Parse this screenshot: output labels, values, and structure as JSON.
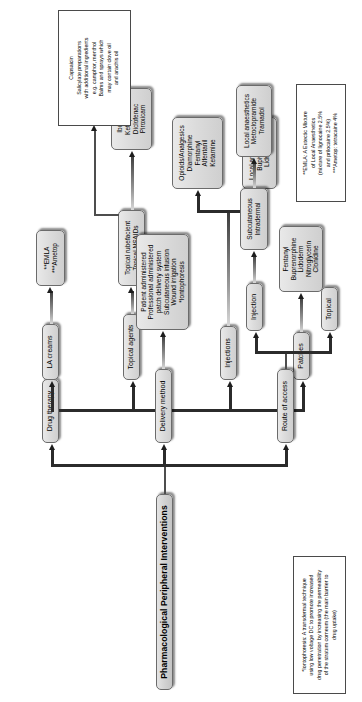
{
  "diagram": {
    "orientation": "rotated-90-ccw",
    "title": "Pharmacological Peripheral Interventions",
    "root": {
      "label": "Pharmacological Peripheral Interventions"
    },
    "branches": [
      {
        "id": "drug-therapy",
        "label": "Drug therapy"
      },
      {
        "id": "delivery-method",
        "label": "Delivery method"
      },
      {
        "id": "route-of-access",
        "label": "Route of access"
      }
    ],
    "nodes": {
      "la_creams": {
        "label": "LA creams"
      },
      "la_creams_drugs": {
        "label": "**EMLA\n***Ametop"
      },
      "topical_agents": {
        "label": "Topical agents"
      },
      "topical_classes": {
        "label": "Topical rubefacient\nTopical NSAIDs"
      },
      "nsaid_drugs": {
        "label": "Ibuprofen\nKetoprofen\nDiclofenac\nPiroxicam"
      },
      "injections": {
        "label": "Injections"
      },
      "opioids": {
        "label": "Opioids/Analgesics\nDiamorphine\nFentanyl\nAlfentanil\nKetamine"
      },
      "local_anaes": {
        "label": "Local anaesthetics\nBupivacaine\nLidocaine"
      },
      "patches": {
        "label": "Patches"
      },
      "patch_drugs": {
        "label": "Fentanyl\nBuprenorphine\nLidoderm\nNitroglycerin\nClonidine"
      },
      "delivery_list": {
        "label": "Patient administered\nProfessional administered\npatch delivery system\nSubcutaneous infusion\nWound irrigation\n*Iontophoresis"
      },
      "injection": {
        "label": "Injection"
      },
      "topical": {
        "label": "Topical"
      },
      "sc_id": {
        "label": "Subcutaneous\nIntradermal"
      },
      "injection_drugs": {
        "label": "Local anaesthetics\nMetoclopramide\nTramadol"
      }
    },
    "notes": {
      "rubefacient": "Capsaicin\nSalicylate preparations\nwith additional ingredients\ne.g. camphor, menthol\nBalms and sprays which\nmay contain clove oil\nand arachis oil",
      "emla": "**EMLA: A Eutectic Mixture\nof Local Anaesthetics\n(mixture of lignocaine 2.5%\nand prilocaine 2.5%)\n***Ametop: tetracaine 4%",
      "iontophoresis": "*Iontophoresis: A transdermal technique\nusing low voltage DC to promote increased\ndrug penetration by increasing the permeability\nof the stratum corneum (the main barrier to\ndrug uptake)"
    },
    "colors": {
      "node_fill": "#dcdcdc",
      "node_border": "#6b6b6b",
      "note_fill": "#ffffff",
      "connector": "#4d4d4d",
      "background": "#ffffff"
    }
  }
}
